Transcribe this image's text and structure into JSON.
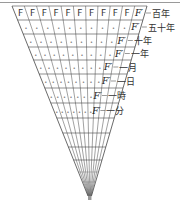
{
  "diagram": {
    "columns": 11,
    "top_cell_label": "F",
    "shifted_cell_label": "F′",
    "placeholder_glyph": "•",
    "rows": [
      {
        "label": "百年",
        "cells": [
          "F",
          "F",
          "F",
          "F",
          "F",
          "F",
          "F",
          "F",
          "F",
          "F",
          "F′"
        ]
      },
      {
        "label": "五十年",
        "cells": [
          "•",
          "•",
          "•",
          "•",
          "•",
          "•",
          "•",
          "•",
          "•",
          "•",
          "F′"
        ]
      },
      {
        "label": "十年",
        "cells": [
          "•",
          "•",
          "•",
          "•",
          "•",
          "•",
          "•",
          "•",
          "•",
          "F′"
        ]
      },
      {
        "label": "一年",
        "cells": [
          "•",
          "•",
          "•",
          "•",
          "•",
          "•",
          "•",
          "•",
          "•",
          "F′"
        ]
      },
      {
        "label": "一月",
        "cells": [
          "•",
          "•",
          "•",
          "•",
          "•",
          "•",
          "•",
          "•",
          "F′"
        ]
      },
      {
        "label": "一日",
        "cells": [
          "•",
          "•",
          "•",
          "•",
          "•",
          "•",
          "•",
          "•",
          "F′"
        ]
      },
      {
        "label": "一時",
        "cells": [
          "•",
          "•",
          "•",
          "•",
          "•",
          "•",
          "•",
          "F′"
        ]
      },
      {
        "label": "一分",
        "cells": [
          "•",
          "•",
          "•",
          "•",
          "•",
          "•",
          "•",
          "F′"
        ]
      }
    ],
    "line_color": "#444444",
    "text_color": "#333333"
  }
}
